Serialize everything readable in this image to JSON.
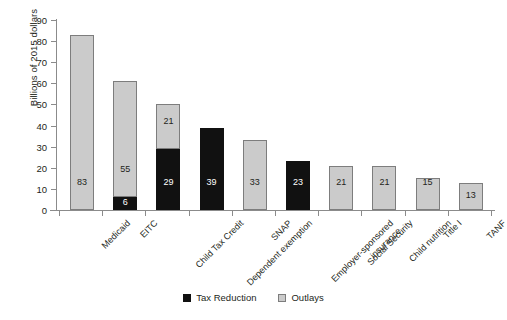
{
  "chart_data": {
    "type": "bar",
    "title": "",
    "subtitle": "",
    "xlabel": "",
    "ylabel": "Billions of 2015 dollars",
    "ylim": [
      0,
      90
    ],
    "yticks": [
      0,
      10,
      20,
      30,
      40,
      50,
      60,
      70,
      80,
      90
    ],
    "ytick_labels": [
      "0",
      "10",
      "20",
      "30",
      "40",
      "50",
      "60",
      "70",
      "80",
      "90"
    ],
    "grid": false,
    "stacked": true,
    "legend_position": "bottom-center",
    "categories": [
      "Medicaid",
      "EITC",
      "Child Tax Credit",
      "Dependent exemption",
      "SNAP",
      "Employer-sponsored\ninsurance",
      "Social Security",
      "Child nutrition",
      "Title I",
      "TANF"
    ],
    "series": [
      {
        "name": "Tax Reduction",
        "color": "#111111",
        "values": [
          0,
          6,
          29,
          39,
          0,
          23,
          0,
          0,
          0,
          0
        ]
      },
      {
        "name": "Outlays",
        "color": "#cbcbcb",
        "values": [
          83,
          55,
          21,
          0,
          33,
          0,
          21,
          21,
          15,
          13
        ]
      }
    ],
    "totals": [
      83,
      61,
      50,
      39,
      33,
      23,
      21,
      21,
      15,
      13
    ]
  },
  "legend": {
    "items": [
      {
        "label": "Tax Reduction",
        "swatch": "black-square"
      },
      {
        "label": "Outlays",
        "swatch": "gray-square"
      }
    ]
  },
  "axes": {
    "y_title": "Billions of 2015 dollars"
  },
  "colors": {
    "tax_reduction": "#111111",
    "outlays": "#cbcbcb",
    "axis": "#8b8b8b",
    "text": "#231f20",
    "background": "#ffffff",
    "bar_border": "#7d7d7d"
  }
}
